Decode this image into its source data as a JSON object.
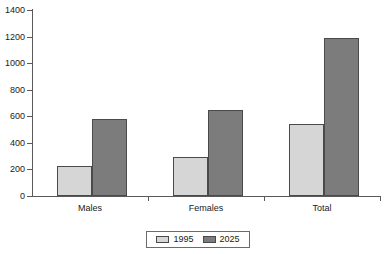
{
  "chart_data": {
    "type": "bar",
    "title": "",
    "subtitle": "",
    "xlabel": "",
    "ylabel": "",
    "categories": [
      "Males",
      "Females",
      "Total"
    ],
    "series": [
      {
        "name": "1995",
        "color": "#d6d6d6",
        "values": [
          225,
          295,
          545
        ]
      },
      {
        "name": "2025",
        "color": "#7c7c7c",
        "values": [
          580,
          645,
          1190
        ]
      }
    ],
    "ylim": [
      0,
      1400
    ],
    "ytick_step": 200,
    "yticks": [
      0,
      200,
      400,
      600,
      800,
      1000,
      1200,
      1400
    ],
    "ytick_labels": [
      "0",
      "200",
      "400",
      "600",
      "800",
      "1000",
      "1200",
      "1400"
    ],
    "grid": false,
    "legend_position": "bottom",
    "legend_entries": [
      {
        "label": "1995",
        "swatch": "#d6d6d6"
      },
      {
        "label": "2025",
        "swatch": "#7c7c7c"
      }
    ]
  },
  "axis": {
    "y_labels": [
      "1400",
      "1200",
      "1000",
      "800",
      "600",
      "400",
      "200",
      "0"
    ],
    "x_labels": [
      "Males",
      "Females",
      "Total"
    ]
  },
  "legend": {
    "items": [
      {
        "label": "1995"
      },
      {
        "label": "2025"
      }
    ]
  }
}
